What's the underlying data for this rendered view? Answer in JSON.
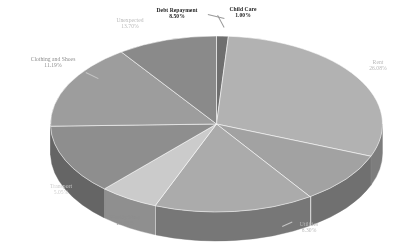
{
  "chart_data": {
    "type": "pie",
    "title": "",
    "subtitle": "",
    "xlabel": "",
    "ylabel": "",
    "legend_position": "none",
    "grid": false,
    "three_d": true,
    "background_color": "#ffffff",
    "total_percent": "100.00%",
    "categories": [
      "Child Care",
      "Rent",
      "Utilities",
      "Weekly Shop",
      "Transport",
      "Clothing and Shoes",
      "Unexpected",
      "Debt Repayment"
    ],
    "values": [
      1.0,
      26.08,
      8.3,
      13.6,
      5.05,
      11.19,
      13.7,
      8.5
    ],
    "slices": [
      {
        "label": "Child Care",
        "percent_text": "1.00%",
        "value": 1.0,
        "color": "#6f6f6f",
        "side_color": "#4d4d4d",
        "label_style": "dark"
      },
      {
        "label": "Rent",
        "percent_text": "26.08%",
        "value": 26.08,
        "color": "#b2b2b2",
        "side_color": "#7d7d7d",
        "label_style": "faint"
      },
      {
        "label": "Utilities",
        "percent_text": "8.30%",
        "value": 8.3,
        "color": "#a2a2a2",
        "side_color": "#707070",
        "label_style": "faint"
      },
      {
        "label": "Weekly Shop",
        "percent_text": "13.60%",
        "value": 13.6,
        "color": "#ababab",
        "side_color": "#777777",
        "label_style": "mid"
      },
      {
        "label": "Transport",
        "percent_text": "5.05%",
        "value": 5.05,
        "color": "#cbcbcb",
        "side_color": "#8f8f8f",
        "label_style": "vfaint"
      },
      {
        "label": "Clothing and Shoes",
        "percent_text": "11.19%",
        "value": 11.19,
        "color": "#8e8e8e",
        "side_color": "#656565",
        "label_style": "mid"
      },
      {
        "label": "Unexpected",
        "percent_text": "13.70%",
        "value": 13.7,
        "color": "#9d9d9d",
        "side_color": "#6d6d6d",
        "label_style": "faint"
      },
      {
        "label": "Debt Repayment",
        "percent_text": "8.50%",
        "value": 8.5,
        "color": "#8a8a8a",
        "side_color": "#5f5f5f",
        "label_style": "dark"
      }
    ]
  },
  "labels": {
    "child_care": {
      "name": "Child Care",
      "pct": "1.00%"
    },
    "rent": {
      "name": "Rent",
      "pct": "26.08%"
    },
    "utilities": {
      "name": "Utilities",
      "pct": "8.30%"
    },
    "weekly_shop": {
      "name": "Weekly Shop",
      "pct": "13.60%"
    },
    "transport": {
      "name": "Transport",
      "pct": "5.05%"
    },
    "clothing_and_shoes": {
      "name": "Clothing and Shoes",
      "pct": "11.19%"
    },
    "unexpected": {
      "name": "Unexpected",
      "pct": "13.70%"
    },
    "debt_repayment": {
      "name": "Debt Repayment",
      "pct": "8.50%"
    }
  }
}
